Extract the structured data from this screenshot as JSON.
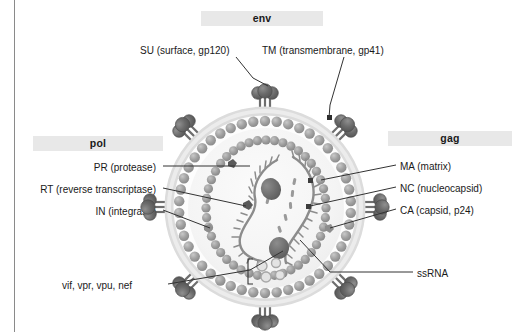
{
  "figure": {
    "title_subject": "HIV virion structure",
    "background_color": "#ffffff",
    "frame_line_color": "#8a8a8a"
  },
  "gene_groups": {
    "env": {
      "title": "env",
      "band_color": "#e8e8e8",
      "labels": [
        {
          "id": "su",
          "text": "SU (surface, gp120)"
        },
        {
          "id": "tm",
          "text": "TM (transmembrane, gp41)"
        }
      ]
    },
    "pol": {
      "title": "pol",
      "band_color": "#e8e8e8",
      "labels": [
        {
          "id": "pr",
          "text": "PR (protease)"
        },
        {
          "id": "rt",
          "text": "RT (reverse transcriptase)"
        },
        {
          "id": "in",
          "text": "IN (integrase)"
        }
      ]
    },
    "gag": {
      "title": "gag",
      "band_color": "#e8e8e8",
      "labels": [
        {
          "id": "ma",
          "text": "MA (matrix)"
        },
        {
          "id": "nc",
          "text": "NC (nucleocapsid)"
        },
        {
          "id": "ca",
          "text": "CA (capsid, p24)"
        }
      ]
    }
  },
  "accessory": {
    "label": "vif, vpr, vpu, nef"
  },
  "genome": {
    "label": "ssRNA"
  },
  "colors": {
    "envelope_outer": "#d9d9d9",
    "envelope_inner": "#efefef",
    "matrix_bead": "#9a9a9a",
    "capsid_dot": "#9a9a9a",
    "spike_head": "#6e6e6e",
    "spike_stalk": "#6e6e6e",
    "rna_strand": "#8c8c8c",
    "leader_line": "#333333",
    "text": "#1a1a1a"
  },
  "diagram_parts": {
    "spike_count": 8,
    "matrix_bead_count": 46,
    "capsid_dot_count": 44,
    "inner_small_circles": 4
  }
}
